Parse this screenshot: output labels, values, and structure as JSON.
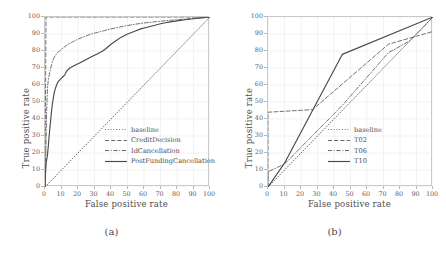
{
  "figure": {
    "panels": [
      {
        "id": "a",
        "caption": "(a)",
        "xlabel": "False positive rate",
        "ylabel": "True positive rate",
        "xticks": [
          "0",
          "10",
          "20",
          "30",
          "40",
          "50",
          "60",
          "70",
          "80",
          "90",
          "100"
        ],
        "yticks": [
          "0",
          "10",
          "20",
          "30",
          "40",
          "50",
          "60",
          "70",
          "80",
          "90",
          "100"
        ]
      },
      {
        "id": "b",
        "caption": "(b)",
        "xlabel": "False positive rate",
        "ylabel": "True positive rate",
        "xticks": [
          "0",
          "10",
          "20",
          "30",
          "40",
          "50",
          "60",
          "70",
          "80",
          "90",
          "100"
        ],
        "yticks": [
          "0",
          "10",
          "20",
          "30",
          "40",
          "50",
          "60",
          "70",
          "80",
          "90",
          "100"
        ]
      }
    ]
  },
  "chart_data": [
    {
      "type": "line",
      "panel": "a",
      "title": "",
      "xlabel": "False positive rate",
      "ylabel": "True positive rate",
      "xlim": [
        0,
        100
      ],
      "ylim": [
        0,
        100
      ],
      "grid": true,
      "legend_position": "lower right",
      "series": [
        {
          "name": "baseline",
          "style": "dotted",
          "color": "#555555",
          "points": [
            [
              0,
              0
            ],
            [
              100,
              100
            ]
          ]
        },
        {
          "name": "CreditDecision",
          "style": "dashed",
          "color": "#5a5a5a",
          "points": [
            [
              0,
              0
            ],
            [
              0.6,
              100
            ],
            [
              100,
              100
            ]
          ]
        },
        {
          "name": "IdCancellation",
          "style": "dashdot",
          "color": "#5a5a5a",
          "points": [
            [
              0,
              0
            ],
            [
              0.5,
              20
            ],
            [
              1,
              45
            ],
            [
              1.5,
              58
            ],
            [
              2,
              63
            ],
            [
              3,
              68
            ],
            [
              4,
              72
            ],
            [
              5,
              75
            ],
            [
              6,
              77
            ],
            [
              8,
              79.5
            ],
            [
              10,
              81
            ],
            [
              12,
              82.5
            ],
            [
              14,
              84
            ],
            [
              16,
              85
            ],
            [
              18,
              86
            ],
            [
              20,
              87
            ],
            [
              24,
              88.5
            ],
            [
              28,
              90
            ],
            [
              32,
              91
            ],
            [
              36,
              92
            ],
            [
              40,
              93
            ],
            [
              45,
              94
            ],
            [
              50,
              95
            ],
            [
              55,
              95.8
            ],
            [
              60,
              96.5
            ],
            [
              65,
              97
            ],
            [
              70,
              97.5
            ],
            [
              75,
              98
            ],
            [
              80,
              98.4
            ],
            [
              85,
              98.8
            ],
            [
              90,
              99.2
            ],
            [
              95,
              99.6
            ],
            [
              100,
              100
            ]
          ]
        },
        {
          "name": "PostFundingCancellation",
          "style": "solid",
          "color": "#4a4a4a",
          "points": [
            [
              0,
              0
            ],
            [
              0.4,
              10
            ],
            [
              0.8,
              15
            ],
            [
              1,
              16
            ],
            [
              1.5,
              19
            ],
            [
              2,
              24
            ],
            [
              2.5,
              30
            ],
            [
              3,
              35
            ],
            [
              3.5,
              40
            ],
            [
              4,
              45
            ],
            [
              4.5,
              49
            ],
            [
              5,
              52
            ],
            [
              5.5,
              55
            ],
            [
              6,
              57
            ],
            [
              7,
              60
            ],
            [
              8,
              62
            ],
            [
              9,
              63
            ],
            [
              10,
              64
            ],
            [
              11,
              65
            ],
            [
              12,
              66
            ],
            [
              13,
              68
            ],
            [
              14,
              69
            ],
            [
              15,
              70
            ],
            [
              17,
              71
            ],
            [
              19,
              72
            ],
            [
              21,
              73
            ],
            [
              23,
              74
            ],
            [
              25,
              75
            ],
            [
              27,
              76
            ],
            [
              29,
              77
            ],
            [
              31,
              78
            ],
            [
              33,
              79
            ],
            [
              35,
              80
            ],
            [
              37,
              81.5
            ],
            [
              40,
              84
            ],
            [
              43,
              86
            ],
            [
              46,
              88
            ],
            [
              50,
              90
            ],
            [
              54,
              91.5
            ],
            [
              58,
              93
            ],
            [
              62,
              94
            ],
            [
              66,
              95
            ],
            [
              70,
              96
            ],
            [
              74,
              96.8
            ],
            [
              78,
              97.4
            ],
            [
              82,
              98
            ],
            [
              86,
              98.5
            ],
            [
              90,
              99
            ],
            [
              95,
              99.5
            ],
            [
              100,
              100
            ]
          ]
        }
      ]
    },
    {
      "type": "line",
      "panel": "b",
      "title": "",
      "xlabel": "False positive rate",
      "ylabel": "True positive rate",
      "xlim": [
        0,
        100
      ],
      "ylim": [
        0,
        100
      ],
      "grid": true,
      "legend_position": "lower right",
      "series": [
        {
          "name": "baseline",
          "style": "dotted",
          "color": "#555555",
          "points": [
            [
              0,
              0
            ],
            [
              100,
              100
            ]
          ]
        },
        {
          "name": "T02",
          "style": "dashed",
          "color": "#5a5a5a",
          "points": [
            [
              0,
              0
            ],
            [
              0,
              44
            ],
            [
              27,
              45.5
            ],
            [
              73,
              84
            ],
            [
              100,
              91.5
            ]
          ]
        },
        {
          "name": "T06",
          "style": "dashdot",
          "color": "#5a5a5a",
          "points": [
            [
              0,
              0
            ],
            [
              0,
              9
            ],
            [
              10,
              13.5
            ],
            [
              45,
              48
            ],
            [
              73,
              79
            ],
            [
              86,
              86
            ],
            [
              100,
              100
            ]
          ]
        },
        {
          "name": "T10",
          "style": "solid",
          "color": "#4a4a4a",
          "points": [
            [
              0,
              0
            ],
            [
              10,
              14
            ],
            [
              45,
              78
            ],
            [
              100,
              100
            ]
          ]
        }
      ]
    }
  ],
  "panel_a_legend": [
    {
      "label": "baseline",
      "style": "dotted"
    },
    {
      "label": "CreditDecision",
      "style": "dashed"
    },
    {
      "label": "IdCancellation",
      "style": "dashdot"
    },
    {
      "label": "PostFundingCancellation",
      "style": "solid"
    }
  ],
  "panel_b_legend": [
    {
      "label": "baseline",
      "style": "dotted"
    },
    {
      "label": "T02",
      "style": "dashed"
    },
    {
      "label": "T06",
      "style": "dashdot"
    },
    {
      "label": "T10",
      "style": "solid"
    }
  ],
  "colors": {
    "frame": "#c9c9c9",
    "grid": "#e6e6e6",
    "line": "#4a4a4a",
    "text": "#4a4a4a"
  }
}
